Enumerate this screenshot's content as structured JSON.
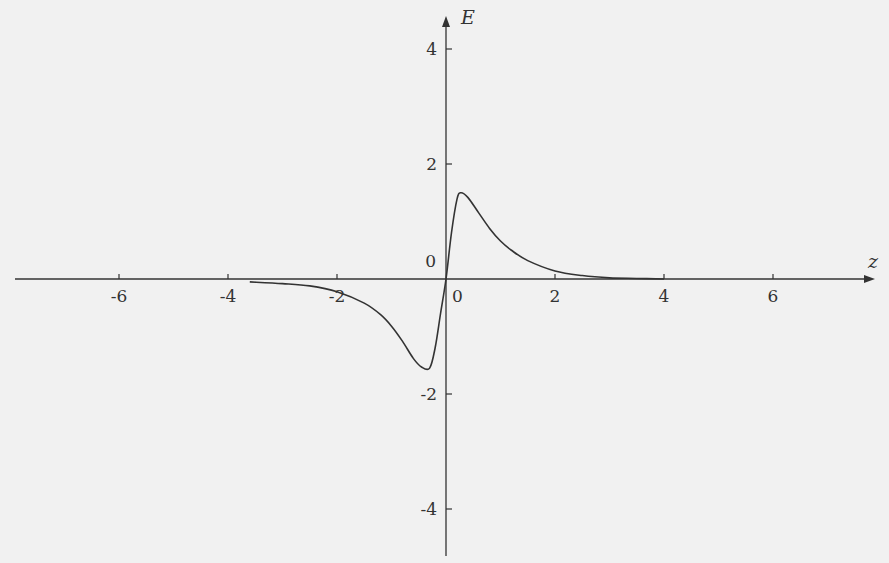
{
  "chart_data": {
    "type": "line",
    "title": "",
    "xlabel": "z",
    "ylabel": "E",
    "xlim": [
      -8,
      8
    ],
    "ylim": [
      -5,
      4.5
    ],
    "grid": false,
    "legend": null,
    "x_ticks": [
      -6,
      -4,
      -2,
      0,
      2,
      4,
      6
    ],
    "y_ticks": [
      -4,
      -2,
      0,
      2,
      4
    ],
    "x_tick_labels": [
      "-6",
      "-4",
      "-2",
      "0",
      "2",
      "4",
      "6"
    ],
    "y_tick_labels": [
      "-4",
      "-2",
      "0",
      "2",
      "4"
    ],
    "series": [
      {
        "name": "E(z)",
        "x": [
          -3.6,
          -3.0,
          -2.5,
          -2.0,
          -1.5,
          -1.2,
          -1.0,
          -0.8,
          -0.6,
          -0.45,
          -0.3,
          -0.2,
          -0.1,
          0.0,
          0.1,
          0.2,
          0.27,
          0.4,
          0.6,
          0.8,
          1.0,
          1.2,
          1.5,
          2.0,
          2.5,
          3.0,
          3.5,
          4.0
        ],
        "values": [
          -0.05,
          -0.08,
          -0.12,
          -0.22,
          -0.42,
          -0.62,
          -0.82,
          -1.08,
          -1.38,
          -1.53,
          -1.55,
          -1.2,
          -0.6,
          0.0,
          0.8,
          1.38,
          1.5,
          1.42,
          1.15,
          0.88,
          0.66,
          0.5,
          0.32,
          0.14,
          0.06,
          0.02,
          0.01,
          0.0
        ]
      }
    ]
  },
  "axes": {
    "x_label": "z",
    "y_label": "E",
    "origin_x_label": "0",
    "origin_y_label": "0"
  }
}
